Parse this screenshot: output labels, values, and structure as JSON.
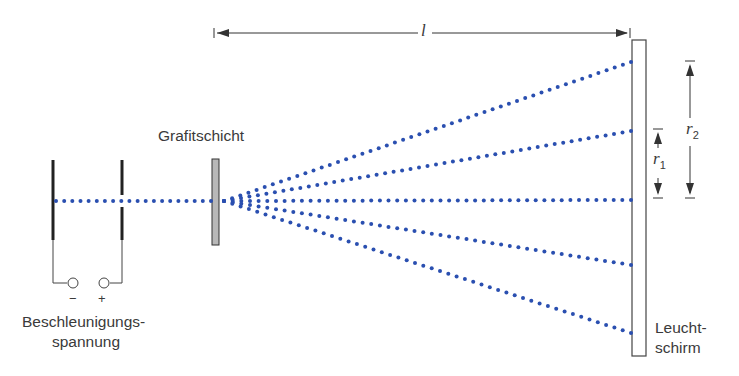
{
  "diagram": {
    "labels": {
      "graphite": "Grafitschicht",
      "voltage_line1": "Beschleunigungs-",
      "voltage_line2": "spannung",
      "minus": "−",
      "plus": "+",
      "screen_line1": "Leucht-",
      "screen_line2": "schirm",
      "distance": "l",
      "r1": "r",
      "r1_sub": "1",
      "r2": "r",
      "r2_sub": "2"
    },
    "colors": {
      "beam": "#2a4fb0",
      "stroke": "#3a3a3a",
      "graphite_fill": "#b8b8b8"
    },
    "beam_rays": [
      "top-outer",
      "top-inner",
      "center",
      "bottom-inner",
      "bottom-outer"
    ]
  }
}
